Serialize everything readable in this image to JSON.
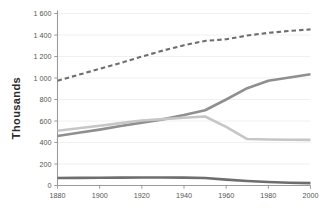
{
  "chart_data": {
    "type": "line",
    "title": "",
    "subtitle": "",
    "xlabel": "",
    "ylabel": "Thousands",
    "xlim": [
      1880,
      2000
    ],
    "ylim": [
      0,
      1600
    ],
    "grid": true,
    "legend_position": "none",
    "x_ticks": [
      "1880",
      "1900",
      "1920",
      "1940",
      "1960",
      "1980",
      "2000"
    ],
    "x_tick_values": [
      1880,
      1900,
      1920,
      1940,
      1960,
      1980,
      2000
    ],
    "y_ticks": [
      "0",
      "200",
      "400",
      "600",
      "800",
      "1 000",
      "1 200",
      "1 400",
      "1 600"
    ],
    "y_tick_values": [
      0,
      200,
      400,
      600,
      800,
      1000,
      1200,
      1400,
      1600
    ],
    "x": [
      1880,
      1890,
      1900,
      1910,
      1920,
      1930,
      1940,
      1950,
      1960,
      1970,
      1980,
      1990,
      2000
    ],
    "series": [
      {
        "name": "Total (dashed)",
        "style": "dashed",
        "color": "#6e6e6e",
        "width": 2.1,
        "dasharray": "4.5 3",
        "values": [
          975,
          1030,
          1085,
          1140,
          1200,
          1255,
          1305,
          1345,
          1360,
          1395,
          1420,
          1438,
          1452
        ]
      },
      {
        "name": "Rising series (medium grey)",
        "style": "solid",
        "color": "#8f8f8f",
        "width": 2.6,
        "dasharray": "",
        "values": [
          460,
          490,
          520,
          553,
          585,
          615,
          655,
          700,
          800,
          905,
          975,
          1005,
          1035
        ]
      },
      {
        "name": "Peaking series (light grey)",
        "style": "solid",
        "color": "#c6c6c6",
        "width": 2.6,
        "dasharray": "",
        "values": [
          510,
          533,
          556,
          580,
          605,
          617,
          630,
          642,
          545,
          432,
          428,
          426,
          424
        ]
      },
      {
        "name": "Low series (dark grey)",
        "style": "solid",
        "color": "#6e6e6e",
        "width": 2.6,
        "dasharray": "",
        "values": [
          70,
          71,
          72,
          73,
          74,
          74,
          73,
          70,
          55,
          42,
          32,
          26,
          22
        ]
      }
    ]
  },
  "colors": {
    "background": "#ffffff",
    "grid": "#ececec",
    "axis": "#9a9a9a",
    "tick_text": "#555555",
    "axis_title": "#2b2b2b",
    "series_dashed": "#6e6e6e",
    "series_medium": "#8f8f8f",
    "series_light": "#c6c6c6",
    "series_dark": "#6e6e6e"
  }
}
